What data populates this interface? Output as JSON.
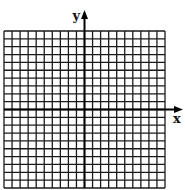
{
  "diagram": {
    "type": "coordinate-grid",
    "grid": {
      "columns": 20,
      "rows": 20,
      "left": 4,
      "top": 31,
      "width": 161,
      "height": 157,
      "line_color": "#1a1a1a"
    },
    "axes": {
      "x_label": "x",
      "y_label": "y",
      "origin_col": 10,
      "origin_row": 10,
      "color": "#000000"
    }
  }
}
